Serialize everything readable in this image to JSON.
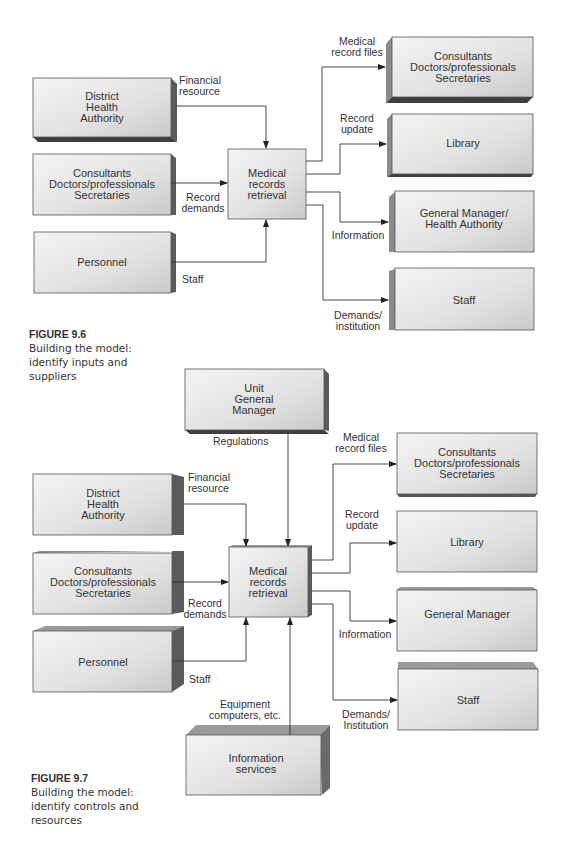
{
  "figures": [
    {
      "id": "fig-9-6",
      "caption": {
        "number": "FIGURE 9.6",
        "lines": [
          "Building the model:",
          "identify inputs and",
          "suppliers"
        ]
      },
      "process": {
        "lines": [
          "Medical",
          "records",
          "retrieval"
        ]
      },
      "suppliers": [
        {
          "lines": [
            "District",
            "Health",
            "Authority"
          ],
          "flow": [
            "Financial",
            "resource"
          ]
        },
        {
          "lines": [
            "Consultants",
            "Doctors/professionals",
            "Secretaries"
          ],
          "flow": [
            "Record",
            "demands"
          ]
        },
        {
          "lines": [
            "Personnel"
          ],
          "flow": [
            "Staff"
          ]
        }
      ],
      "customers": [
        {
          "lines": [
            "Consultants",
            "Doctors/professionals",
            "Secretaries"
          ],
          "flow": [
            "Medical",
            "record files"
          ]
        },
        {
          "lines": [
            "Library"
          ],
          "flow": [
            "Record",
            "update"
          ]
        },
        {
          "lines": [
            "General Manager/",
            "Health Authority"
          ],
          "flow": [
            "Information"
          ]
        },
        {
          "lines": [
            "Staff"
          ],
          "flow": [
            "Demands/",
            "institution"
          ]
        }
      ]
    },
    {
      "id": "fig-9-7",
      "caption": {
        "number": "FIGURE 9.7",
        "lines": [
          "Building the model:",
          "identify controls and",
          "resources"
        ]
      },
      "process": {
        "lines": [
          "Medical",
          "records",
          "retrieval"
        ]
      },
      "control": {
        "lines": [
          "Unit",
          "General",
          "Manager"
        ],
        "flow": [
          "Regulations"
        ]
      },
      "resource": {
        "lines": [
          "Information",
          "services"
        ],
        "flow": [
          "Equipment",
          "computers, etc."
        ]
      },
      "suppliers": [
        {
          "lines": [
            "District",
            "Health",
            "Authority"
          ],
          "flow": [
            "Financial",
            "resource"
          ]
        },
        {
          "lines": [
            "Consultants",
            "Doctors/professionals",
            "Secretaries"
          ],
          "flow": [
            "Record",
            "demands"
          ]
        },
        {
          "lines": [
            "Personnel"
          ],
          "flow": [
            "Staff"
          ]
        }
      ],
      "customers": [
        {
          "lines": [
            "Consultants",
            "Doctors/professionals",
            "Secretaries"
          ],
          "flow": [
            "Medical",
            "record files"
          ]
        },
        {
          "lines": [
            "Library"
          ],
          "flow": [
            "Record",
            "update"
          ]
        },
        {
          "lines": [
            "General Manager"
          ],
          "flow": [
            "Information"
          ]
        },
        {
          "lines": [
            "Staff"
          ],
          "flow": [
            "Demands/",
            "Institution"
          ]
        }
      ]
    }
  ],
  "colors": {
    "box_light": "#f2f2f2",
    "box_mid": "#d6d6d6",
    "box_side": "#7a7a7a",
    "box_top": "#9a9a9a",
    "line": "#333333"
  }
}
